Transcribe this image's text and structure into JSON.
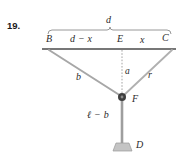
{
  "figure": {
    "problem_number": "19.",
    "background_color": "#ffffff",
    "beam_color": "#4a4a4a",
    "cable_color": "#a0a0a0",
    "rod_color": "#9a9a9a",
    "node_color": "#3a3a3a",
    "brace_color": "#8c8c8c",
    "dotted_color": "#9a9a9a",
    "weight_color": "#c8c8c8"
  },
  "labels": {
    "span_total": "d",
    "point_left": "B",
    "segment_left": "d − x",
    "point_mid": "E",
    "segment_right": "x",
    "point_right": "C",
    "cable_left": "b",
    "height_drop": "a",
    "cable_right": "r",
    "point_node": "F",
    "rod_length": "ℓ − b",
    "point_weight": "D"
  },
  "geometry": {
    "beam_y": 49,
    "beam_x_left": 42,
    "beam_x_right": 176,
    "point_B": [
      49,
      49
    ],
    "point_E": [
      122,
      49
    ],
    "point_C": [
      172,
      49
    ],
    "point_F": [
      122,
      97
    ],
    "point_D": [
      122,
      145
    ],
    "brace_y": 30,
    "brace_x_left": 48,
    "brace_x_right": 171
  }
}
